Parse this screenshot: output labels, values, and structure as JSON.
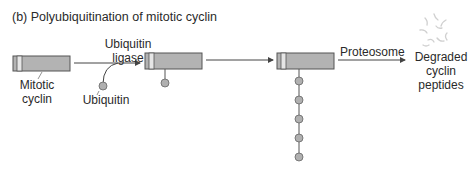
{
  "title": "(b) Polyubiquitination of mitotic cyclin",
  "labels": {
    "ligase_line1": "Ubiquitin",
    "ligase_line2": "ligase",
    "mitotic_line1": "Mitotic",
    "mitotic_line2": "cyclin",
    "ubiquitin": "Ubiquitin",
    "proteosome": "Proteosome",
    "degraded_line1": "Degraded",
    "degraded_line2": "cyclin",
    "degraded_line3": "peptides"
  },
  "colors": {
    "box_fill": "#b3b3b3",
    "box_stripe": "#e6e6e6",
    "ubiquitin_fill": "#b0b0b0",
    "line": "#444444"
  },
  "diagram": {
    "stages": [
      "Mitotic cyclin",
      "Monoubiquitinated cyclin",
      "Polyubiquitinated cyclin",
      "Degraded cyclin peptides"
    ],
    "polyubiquitin_count": 5
  }
}
